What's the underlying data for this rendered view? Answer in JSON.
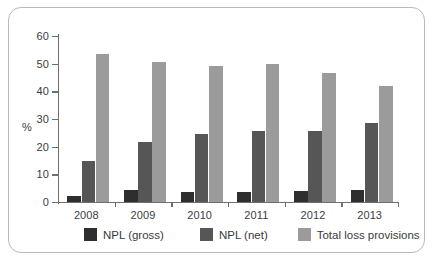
{
  "chart_data": {
    "type": "bar",
    "title": "",
    "subtitle": "",
    "xlabel": "",
    "ylabel": "%",
    "categories": [
      "2008",
      "2009",
      "2010",
      "2011",
      "2012",
      "2013"
    ],
    "series": [
      {
        "name": "NPL (gross)",
        "color": "#2e2e2e",
        "values": [
          2.3,
          4.2,
          3.7,
          3.8,
          4.1,
          4.4
        ]
      },
      {
        "name": "NPL (net)",
        "color": "#565656",
        "values": [
          15.0,
          21.7,
          24.5,
          25.5,
          25.6,
          28.5
        ]
      },
      {
        "name": "Total loss provisions",
        "color": "#9b9b9b",
        "values": [
          53.5,
          50.5,
          49.0,
          50.0,
          46.5,
          42.0
        ]
      }
    ],
    "ylim": [
      0,
      60
    ],
    "ytick_step": 10,
    "yticks": [
      "0",
      "10",
      "20",
      "30",
      "40",
      "50",
      "60"
    ],
    "grid": false,
    "legend_position": "bottom",
    "orientation": "vertical",
    "grouping": "grouped"
  },
  "legend": {
    "items": [
      {
        "label": "NPL (gross)"
      },
      {
        "label": "NPL (net)"
      },
      {
        "label": "Total loss provisions"
      }
    ]
  }
}
